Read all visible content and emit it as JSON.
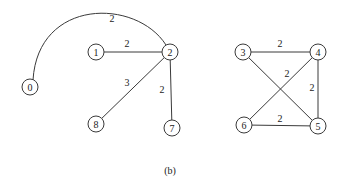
{
  "caption": "(b)",
  "graphs": [
    {
      "name": "left-graph",
      "nodes": [
        {
          "id": "0",
          "x": 30,
          "y": 87
        },
        {
          "id": "1",
          "x": 96,
          "y": 52
        },
        {
          "id": "2",
          "x": 170,
          "y": 52
        },
        {
          "id": "8",
          "x": 96,
          "y": 124
        },
        {
          "id": "7",
          "x": 172,
          "y": 128
        }
      ],
      "edges": [
        {
          "from": "0",
          "to": "2",
          "weight": "2",
          "curved": true,
          "label_x": 112,
          "label_y": 18
        },
        {
          "from": "1",
          "to": "2",
          "weight": "2",
          "label_x": 127,
          "label_y": 43
        },
        {
          "from": "8",
          "to": "2",
          "weight": "3",
          "label_x": 127,
          "label_y": 82
        },
        {
          "from": "2",
          "to": "7",
          "weight": "2",
          "label_x": 162,
          "label_y": 89
        }
      ]
    },
    {
      "name": "right-graph",
      "nodes": [
        {
          "id": "3",
          "x": 243,
          "y": 52
        },
        {
          "id": "4",
          "x": 318,
          "y": 52
        },
        {
          "id": "6",
          "x": 244,
          "y": 125
        },
        {
          "id": "5",
          "x": 318,
          "y": 126
        }
      ],
      "edges": [
        {
          "from": "3",
          "to": "4",
          "weight": "2",
          "label_x": 280,
          "label_y": 43
        },
        {
          "from": "3",
          "to": "5",
          "weight": "",
          "label_x": 0,
          "label_y": 0
        },
        {
          "from": "6",
          "to": "4",
          "weight": "2",
          "label_x": 287,
          "label_y": 73
        },
        {
          "from": "4",
          "to": "5",
          "weight": "2",
          "label_x": 312,
          "label_y": 87
        },
        {
          "from": "6",
          "to": "5",
          "weight": "2",
          "label_x": 280,
          "label_y": 118
        }
      ]
    }
  ],
  "colors": {
    "stroke": "#3a3a3a",
    "text": "#222222",
    "background": "#ffffff"
  }
}
